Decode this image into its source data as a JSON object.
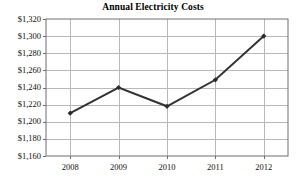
{
  "chart_data": {
    "type": "line",
    "title": "Annual Electricity Costs",
    "xlabel": "",
    "ylabel": "",
    "categories": [
      "2008",
      "2009",
      "2010",
      "2011",
      "2012"
    ],
    "values": [
      1210,
      1240,
      1218,
      1249,
      1300
    ],
    "ylim": [
      1160,
      1320
    ],
    "ytick_labels": [
      "$1,320",
      "$1,300",
      "$1,280",
      "$1,260",
      "$1,240",
      "$1,220",
      "$1,200",
      "$1,180",
      "$1,160"
    ],
    "ytick_values": [
      1320,
      1300,
      1280,
      1260,
      1240,
      1220,
      1200,
      1180,
      1160
    ],
    "xtick_labels": [
      "2008",
      "2009",
      "2010",
      "2011",
      "2012"
    ],
    "grid": true,
    "legend": "none",
    "series": [
      {
        "name": "Annual Electricity Costs",
        "values": [
          1210,
          1240,
          1218,
          1249,
          1300
        ]
      }
    ],
    "colors": {
      "line": "#333333",
      "marker": "#2b2b2b",
      "grid": "#b9b9b9",
      "axis": "#6f6f6f",
      "background": "#ffffff"
    },
    "marker_style": "diamond",
    "line_width": 2
  }
}
